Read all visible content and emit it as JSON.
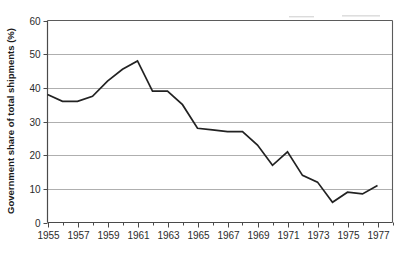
{
  "chart_data": {
    "type": "line",
    "title": "",
    "subtitle": "",
    "xlabel": "",
    "ylabel": "Government share of  total shipments (%)",
    "xlim": [
      1955,
      1978
    ],
    "ylim": [
      0,
      60
    ],
    "ytick_values": [
      0,
      10,
      20,
      30,
      40,
      50,
      60
    ],
    "ytick_labels": [
      "0",
      "10",
      "20",
      "30",
      "40",
      "50",
      "60"
    ],
    "xtick_labels": [
      "1955",
      "1957",
      "1959",
      "1961",
      "1963",
      "1965",
      "1967",
      "1969",
      "1971",
      "1973",
      "1975",
      "1977"
    ],
    "xtick_values": [
      1955,
      1957,
      1959,
      1961,
      1963,
      1965,
      1967,
      1969,
      1971,
      1973,
      1975,
      1977
    ],
    "minor_xticks": [
      1956,
      1958,
      1960,
      1962,
      1964,
      1966,
      1968,
      1970,
      1972,
      1974,
      1976,
      1978
    ],
    "grid": "horizontal",
    "legend": "none",
    "line_color": "#222222",
    "grid_color": "#9a9a9a",
    "frame_color": "#5b5b5b",
    "x": [
      1955,
      1956,
      1957,
      1958,
      1959,
      1960,
      1961,
      1962,
      1963,
      1964,
      1965,
      1966,
      1967,
      1968,
      1969,
      1970,
      1971,
      1972,
      1973,
      1974,
      1975,
      1976,
      1977
    ],
    "values": [
      38,
      36,
      36,
      37.5,
      42,
      45.5,
      48,
      39,
      39,
      35,
      28,
      27.5,
      27,
      27,
      23,
      17,
      21,
      14,
      12,
      6,
      9,
      8.5,
      11
    ],
    "series": [
      {
        "name": "Government share of total shipments",
        "values": [
          38,
          36,
          36,
          37.5,
          42,
          45.5,
          48,
          39,
          39,
          35,
          28,
          27.5,
          27,
          27,
          23,
          17,
          21,
          14,
          12,
          6,
          9,
          8.5,
          11
        ]
      }
    ],
    "annotations": []
  }
}
